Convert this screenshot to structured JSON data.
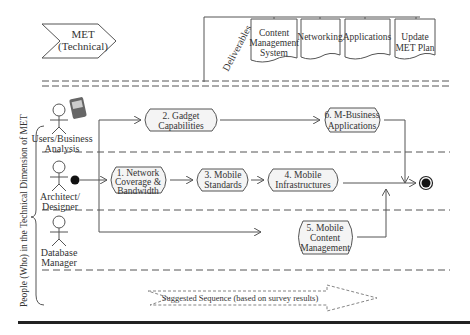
{
  "header": {
    "chevron_line1": "MET",
    "chevron_line2": "(Technical)",
    "deliverables_label": "Deliverables",
    "deliverables": [
      {
        "line1": "Content",
        "line2": "Management",
        "line3": "System"
      },
      {
        "line1": "Networking"
      },
      {
        "line1": "Applications"
      },
      {
        "line1": "Update",
        "line2": "MET Plan"
      }
    ]
  },
  "side_label": "People (Who) in the Technical Dimension of MET",
  "actors": [
    {
      "line1": "Users/Business",
      "line2": "Analysis"
    },
    {
      "line1": "Architect/",
      "line2": "Designer"
    },
    {
      "line1": "Database",
      "line2": "Manager"
    }
  ],
  "activities": {
    "a1": {
      "line1": "1. Network",
      "line2": "Coverage &",
      "line3": "Bandwidth"
    },
    "a2": {
      "line1": "2. Gadget",
      "line2": "Capabilities"
    },
    "a3": {
      "line1": "3. Mobile",
      "line2": "Standards"
    },
    "a4": {
      "line1": "4. Mobile",
      "line2": "Infrastructures"
    },
    "a5": {
      "line1": "5. Mobile",
      "line2": "Content",
      "line3": "Management"
    },
    "a6": {
      "line1": "6. M-Business",
      "line2": "Applications"
    }
  },
  "legend": {
    "label": "Suggested Sequence (based on survey results)"
  },
  "colors": {
    "stroke": "#555555",
    "box_fill": "#f4f4f4",
    "text": "#333333"
  }
}
